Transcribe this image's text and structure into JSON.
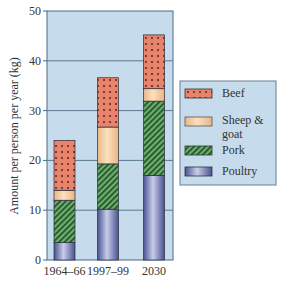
{
  "chart_data": {
    "type": "bar",
    "stacked": true,
    "title": "",
    "xlabel": "",
    "ylabel": "Amount per person per year (kg)",
    "ylim": [
      0,
      50
    ],
    "yticks": [
      0,
      10,
      20,
      30,
      40,
      50
    ],
    "grid": true,
    "legend_position": "right",
    "categories": [
      "1964–66",
      "1997–99",
      "2030"
    ],
    "series": [
      {
        "name": "Poultry",
        "values": [
          3.5,
          10.2,
          17.0
        ],
        "color": "#8a92c6",
        "pattern": "gradient"
      },
      {
        "name": "Pork",
        "values": [
          8.5,
          9.1,
          14.9
        ],
        "color": "#4f9a56",
        "pattern": "hatch"
      },
      {
        "name": "Sheep & goat",
        "values": [
          2.0,
          7.4,
          2.5
        ],
        "color": "#f6cfa0",
        "pattern": "solid"
      },
      {
        "name": "Beef",
        "values": [
          10.0,
          9.9,
          10.8
        ],
        "color": "#e8836c",
        "pattern": "dots"
      }
    ],
    "totals": [
      24.0,
      36.6,
      45.2
    ]
  },
  "legend": {
    "items": [
      {
        "label": "Beef",
        "key": "beef"
      },
      {
        "label_line1": "Sheep &",
        "label_line2": "goat",
        "key": "sheep"
      },
      {
        "label": "Pork",
        "key": "pork"
      },
      {
        "label": "Poultry",
        "key": "poultry"
      }
    ]
  },
  "colors": {
    "plot_background": "#c6dced",
    "gridline": "#5a7890",
    "axis": "#4a6a84"
  }
}
